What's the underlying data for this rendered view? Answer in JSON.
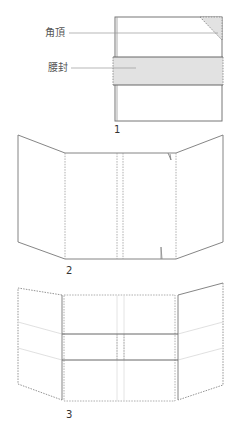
{
  "diagram1": {
    "number": "1",
    "labels": {
      "corner": "角頂",
      "band": "腰封"
    }
  },
  "diagram2": {
    "number": "2"
  },
  "diagram3": {
    "number": "3"
  },
  "colors": {
    "line": "#666666",
    "dash": "#888888",
    "fill": "#e2e2e2",
    "faint": "#dddddd"
  }
}
